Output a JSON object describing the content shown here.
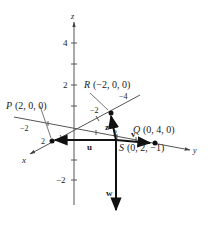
{
  "figure": {
    "axes": {
      "x_label": "x",
      "y_label": "y",
      "z_label": "z",
      "z_ticks": [
        "4",
        "2",
        "−2"
      ],
      "x_ticks": [
        "2"
      ],
      "y_ticks": [
        "−2"
      ],
      "neg_x_ticks": [
        "−2",
        "−4"
      ]
    },
    "points": {
      "P": {
        "name": "P",
        "coords": "(2, 0, 0)"
      },
      "Q": {
        "name": "Q",
        "coords": "(0, 4, 0)"
      },
      "R": {
        "name": "R",
        "coords": "(−2, 0, 0)"
      },
      "S": {
        "name": "S",
        "coords": "(0, 2, −1)"
      }
    },
    "vectors": {
      "u": "u",
      "v": "v",
      "w": "w",
      "z": "z"
    },
    "extra_tick_label": "2",
    "colors": {
      "ink": "#1a1a1a",
      "axis": "#555555"
    }
  }
}
